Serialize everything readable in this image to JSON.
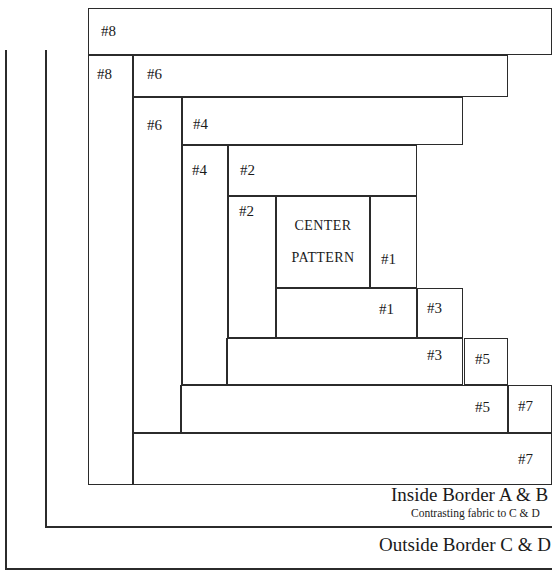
{
  "diagram": {
    "center": {
      "line1": "CENTER",
      "line2": "PATTERN"
    },
    "strip_labels": {
      "s1_right": "#1",
      "s1_bottom": "#1",
      "s2_left": "#2",
      "s2_top": "#2",
      "s3_right": "#3",
      "s3_bottom": "#3",
      "s4_left": "#4",
      "s4_top": "#4",
      "s5_right": "#5",
      "s5_bottom": "#5",
      "s6_left": "#6",
      "s6_top": "#6",
      "s7_right": "#7",
      "s7_bottom": "#7",
      "s8_left": "#8",
      "s8_top": "#8"
    },
    "captions": {
      "inside_border": "Inside Border A & B",
      "inside_border_note": "Contrasting fabric to C & D",
      "outside_border": "Outside Border C & D"
    },
    "colors": {
      "stroke": "#2b2b2b",
      "background": "#ffffff",
      "text": "#1a1a1a"
    }
  }
}
